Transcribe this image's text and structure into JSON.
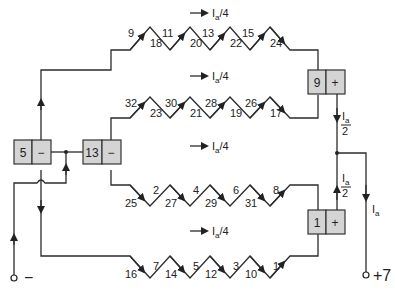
{
  "diagram": {
    "title": "",
    "colors": {
      "wire": "#2b2b2b",
      "brush_box": "#d4d4d4",
      "text": "#222222"
    },
    "current_labels": {
      "quarter": "Ia/4",
      "half": "Ia/2",
      "total": "Ia",
      "sub_a": "a",
      "I": "I",
      "quarter_denom": "/4",
      "half_num": "I",
      "half_den": "2"
    },
    "terminals": {
      "negative": "−",
      "positive": "+7"
    },
    "brushes": [
      {
        "id": "brush-5",
        "number": "5",
        "polarity": "−"
      },
      {
        "id": "brush-13",
        "number": "13",
        "polarity": "−"
      },
      {
        "id": "brush-9",
        "number": "9",
        "polarity": "+"
      },
      {
        "id": "brush-1",
        "number": "1",
        "polarity": "+"
      }
    ],
    "paths": [
      {
        "name": "path-1",
        "upper": [
          "9",
          "11",
          "13",
          "15"
        ],
        "lower": [
          "18",
          "20",
          "22",
          "24"
        ],
        "current": "Ia/4"
      },
      {
        "name": "path-2",
        "upper": [
          "32",
          "30",
          "28",
          "26"
        ],
        "lower": [
          "23",
          "21",
          "19",
          "17"
        ],
        "current": "Ia/4"
      },
      {
        "name": "path-3",
        "upper": [
          "2",
          "4",
          "6",
          "8"
        ],
        "lower": [
          "25",
          "27",
          "29",
          "31"
        ],
        "current": "Ia/4"
      },
      {
        "name": "path-4",
        "upper": [
          "7",
          "5",
          "3",
          "1"
        ],
        "lower": [
          "16",
          "14",
          "12",
          "10"
        ],
        "current": "Ia/4"
      }
    ]
  }
}
